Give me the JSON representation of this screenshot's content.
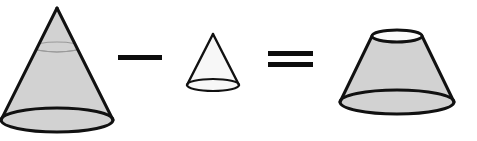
{
  "figure": {
    "title": "Volume of a frustum: large cone minus small cone equals frustum",
    "background_color": "#ffffff",
    "outline_color": "#111111",
    "solid_fill_color": "#d2d2d2",
    "light_fill_color": "#f7f7f7",
    "cut_line_color": "#9a9a9a",
    "equation_text": "large cone - small cone = frustum",
    "terms": [
      {
        "name": "large-cone",
        "role": "minuend",
        "shape": "cone",
        "label": "Large cone",
        "apex": {
          "x": 57,
          "y": 8
        },
        "base_center": {
          "x": 57,
          "y": 120
        },
        "base_rx": 56,
        "base_ry": 12,
        "cut_center": {
          "x": 57,
          "y": 47
        },
        "cut_rx": 24,
        "cut_ry": 5,
        "fill": "#d2d2d2",
        "stroke_width": 3
      },
      {
        "name": "small-cone",
        "role": "subtrahend",
        "shape": "cone",
        "label": "Small cone",
        "apex": {
          "x": 213,
          "y": 34
        },
        "base_center": {
          "x": 213,
          "y": 85
        },
        "base_rx": 26,
        "base_ry": 6,
        "fill": "#f7f7f7",
        "stroke_width": 2.2
      },
      {
        "name": "frustum",
        "role": "result",
        "shape": "frustum",
        "label": "Frustum",
        "top_center": {
          "x": 397,
          "y": 36
        },
        "top_rx": 25,
        "top_ry": 6,
        "bottom_center": {
          "x": 397,
          "y": 102
        },
        "bottom_rx": 57,
        "bottom_ry": 12,
        "fill": "#d2d2d2",
        "stroke_width": 3
      }
    ],
    "operators": [
      {
        "name": "minus-operator",
        "symbol": "minus",
        "label": "−",
        "bars": [
          {
            "x": 118,
            "y": 55,
            "width": 44,
            "height": 5
          }
        ]
      },
      {
        "name": "equals-operator",
        "symbol": "equals",
        "label": "=",
        "bars": [
          {
            "x": 268,
            "y": 51,
            "width": 45,
            "height": 5
          },
          {
            "x": 268,
            "y": 62,
            "width": 45,
            "height": 5
          }
        ]
      }
    ]
  }
}
